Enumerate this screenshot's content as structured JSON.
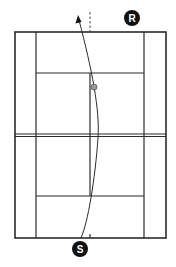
{
  "diagram": {
    "type": "tennis-serve-trajectory",
    "colors": {
      "background": "#ffffff",
      "court_lines": "#2a2a2a",
      "marker_fill": "#111111",
      "marker_text": "#ffffff",
      "ball_fill": "#9a9a9a",
      "ball_stroke": "#555555"
    },
    "markers": {
      "receiver": {
        "label": "R",
        "cx": 132,
        "cy": 18,
        "r": 8
      },
      "server": {
        "label": "S",
        "cx": 80,
        "cy": 249,
        "r": 8
      }
    },
    "ball": {
      "cx": 94,
      "cy": 87,
      "r": 3
    },
    "court": {
      "outer": {
        "x1": 15,
        "y1": 32,
        "x2": 166,
        "y2": 238
      },
      "singles_left_x": 36,
      "singles_right_x": 144,
      "net_y": 135,
      "service_line_top_y": 73,
      "service_line_bottom_y": 196,
      "center_x": 90
    },
    "trajectory": {
      "path": "M81,238 C88,222 95,180 98,138 C100,110 92,70 79,19",
      "arrow_tip": [
        78,
        16
      ]
    },
    "reference_line": {
      "x": 90,
      "y1": 12,
      "y2": 32,
      "style": "dashed"
    }
  }
}
